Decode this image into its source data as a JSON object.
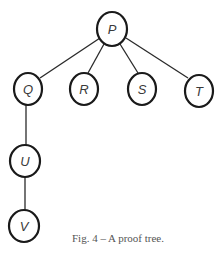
{
  "diagram": {
    "type": "tree",
    "nodes": [
      {
        "id": "P",
        "label": "P",
        "cx": 112,
        "cy": 29
      },
      {
        "id": "Q",
        "label": "Q",
        "cx": 28,
        "cy": 89
      },
      {
        "id": "R",
        "label": "R",
        "cx": 84,
        "cy": 89
      },
      {
        "id": "S",
        "label": "S",
        "cx": 142,
        "cy": 89
      },
      {
        "id": "T",
        "label": "T",
        "cx": 199,
        "cy": 91
      },
      {
        "id": "U",
        "label": "U",
        "cx": 25,
        "cy": 161
      },
      {
        "id": "V",
        "label": "V",
        "cx": 24,
        "cy": 226
      }
    ],
    "edges": [
      {
        "from": "P",
        "to": "Q"
      },
      {
        "from": "P",
        "to": "R"
      },
      {
        "from": "P",
        "to": "S"
      },
      {
        "from": "P",
        "to": "T"
      },
      {
        "from": "Q",
        "to": "U"
      },
      {
        "from": "U",
        "to": "V"
      }
    ]
  },
  "caption": "Fig. 4 – A proof tree."
}
